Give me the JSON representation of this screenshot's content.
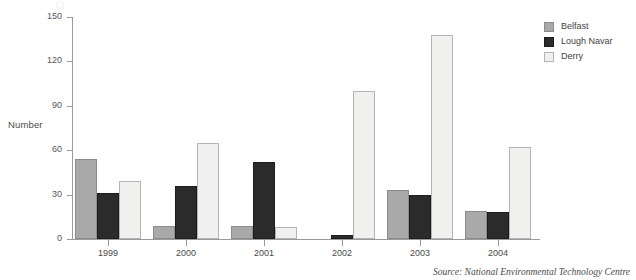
{
  "chart_data": {
    "type": "bar",
    "title": "",
    "subtitle": "",
    "xlabel": "",
    "ylabel": "Number",
    "categories": [
      "1999",
      "2000",
      "2001",
      "2002",
      "2003",
      "2004"
    ],
    "series": [
      {
        "name": "Belfast",
        "color": "#a9a9a9",
        "values": [
          54,
          9,
          9,
          0,
          33,
          19
        ]
      },
      {
        "name": "Lough Navar",
        "color": "#2b2b2b",
        "values": [
          31,
          36,
          52,
          3,
          30,
          18
        ]
      },
      {
        "name": "Derry",
        "color": "#f0f0ee",
        "values": [
          39,
          65,
          8,
          100,
          138,
          62
        ]
      }
    ],
    "ylim": [
      0,
      150
    ],
    "yticks": [
      0,
      30,
      60,
      90,
      120,
      150
    ],
    "ytick_labels": [
      "0",
      "30",
      "60",
      "90",
      "120",
      "150"
    ],
    "grid": false,
    "legend_position": "top-right",
    "source_note": "Source: National Environmental Technology Centre"
  },
  "axes": {
    "y_title": "Number"
  },
  "legend": {
    "entries": [
      {
        "label": "Belfast"
      },
      {
        "label": "Lough Navar"
      },
      {
        "label": "Derry"
      }
    ]
  },
  "footer": {
    "source": "Source: National Environmental Technology Centre"
  }
}
